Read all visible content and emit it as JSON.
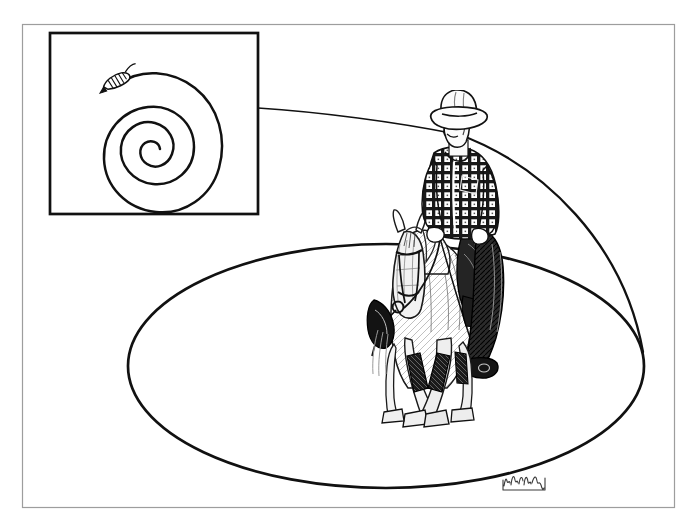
{
  "document": {
    "title": "Reining pattern spiral illustration",
    "medium": "pen-and-ink line drawing",
    "background_color": "#ffffff",
    "ink_color": "#111111",
    "width": 697,
    "height": 526
  },
  "frame": {
    "name": "outer-border",
    "x": 22,
    "y": 24,
    "width": 653,
    "height": 484,
    "stroke_color": "#9a9a9a",
    "stroke_width": 1.2
  },
  "inset_panel": {
    "name": "spiral-diagram-box",
    "x": 50,
    "y": 33,
    "width": 208,
    "height": 181,
    "stroke_color": "#111111",
    "stroke_width": 2.6,
    "fill": "#ffffff"
  },
  "spiral": {
    "name": "spiral-path",
    "center_x": 164,
    "center_y": 149,
    "turns": 3,
    "outer_radius": 58,
    "inner_radius": 5,
    "stroke_color": "#111111",
    "stroke_width": 2.4,
    "description": "Archimedean spiral of roughly three revolutions, wound clockwise inward to a small hook at the centre"
  },
  "spiral_marker": {
    "name": "rider-marker-icon",
    "x": 118,
    "y": 80,
    "rotation_deg": -26,
    "description": "Small stylised horse-and-rider glyph marking the open end of the spiral",
    "stroke_color": "#111111"
  },
  "big_oval": {
    "name": "large-circle-path",
    "center_x": 386,
    "center_y": 366,
    "radius_x": 258,
    "radius_y": 122,
    "stroke_color": "#111111",
    "stroke_width": 2.8,
    "description": "Large perspective circle (ellipse) representing the full-size reining circle on the arena floor"
  },
  "lead_line": {
    "name": "spiral-to-circle-connector",
    "description": "Fine tangent line running from the right edge of the spiral box out to the top-right arc of the large circle",
    "start_x": 258,
    "start_y": 109,
    "end_x": 455,
    "end_y": 133,
    "stroke_color": "#111111",
    "stroke_width": 1.3
  },
  "subject": {
    "name": "horse-and-rider",
    "description": "Front three-quarter view of a western rider on a light-coloured horse, drawn in fine cross-hatched pen line",
    "bounds": {
      "x": 368,
      "y": 95,
      "width": 145,
      "height": 340
    },
    "rider": {
      "name": "cowboy-rider",
      "hat": "light western cowboy hat with creased crown and curled brim",
      "shirt": "dark plaid / checkered western shirt, long sleeves, buttoned collar",
      "chaps": "dark leather shotgun chaps over the legs",
      "hands": "both hands low on the reins at the saddle horn",
      "facing": "head turned slightly to the viewer's left"
    },
    "horse": {
      "name": "reining-horse",
      "coat": "light grey / palomino coat rendered with sparse hatching",
      "head": "head lowered, nose tucked, travelling straight at the viewer",
      "tack": "western headstall with browband, split reins, western saddle with skirts and stirrup",
      "legs": "front legs crossing over in a turn, dark protective splint boots on all four legs",
      "hooves": "four hooves rendered in outline with shading"
    }
  },
  "signature": {
    "name": "artist-signature",
    "text": "",
    "legible": false,
    "description": "Small cursive pen signature, illegible at this resolution",
    "x": 503,
    "y": 476,
    "width": 42,
    "height": 20,
    "stroke_color": "#3a3a3a"
  }
}
